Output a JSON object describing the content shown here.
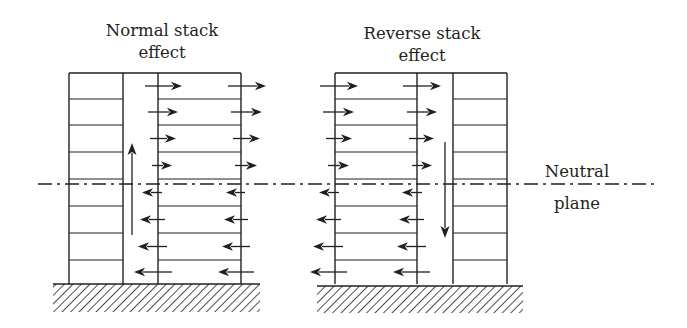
{
  "diagram": {
    "colors": {
      "ink": "#231f20",
      "background": "#ffffff"
    },
    "labels": {
      "normal_line1": "Normal stack",
      "normal_line2": "effect",
      "reverse_line1": "Reverse stack",
      "reverse_line2": "effect",
      "neutral_line1": "Neutral",
      "neutral_line2": "plane"
    },
    "neutral_plane": {
      "y": 184,
      "x_start": 38,
      "x_end": 655
    },
    "floors_y": [
      73,
      99,
      125,
      152,
      179,
      206,
      233,
      260,
      284
    ],
    "buildings": [
      {
        "name": "normal-stack-building",
        "outer_left": 69,
        "shaft_left": 123,
        "shaft_right": 158,
        "outer_right": 241,
        "ground": {
          "x1": 53,
          "x2": 260,
          "y1": 284,
          "y2": 312
        },
        "shaft_flow": {
          "direction": "up",
          "x": 132,
          "y_from": 235,
          "y_to": 143
        },
        "row_arrows": [
          {
            "dir": "right",
            "a": [
              145,
              182
            ],
            "b": [
              228,
              266
            ]
          },
          {
            "dir": "right",
            "a": [
              148,
              178
            ],
            "b": [
              231,
              262
            ]
          },
          {
            "dir": "right",
            "a": [
              150,
              176
            ],
            "b": [
              233,
              260
            ]
          },
          {
            "dir": "right",
            "a": [
              152,
              172
            ],
            "b": [
              235,
              257
            ]
          },
          {
            "dir": "left",
            "a": [
              162,
              142
            ],
            "b": [
              245,
              226
            ]
          },
          {
            "dir": "left",
            "a": [
              165,
              140
            ],
            "b": [
              248,
              224
            ]
          },
          {
            "dir": "left",
            "a": [
              167,
              138
            ],
            "b": [
              250,
              222
            ]
          },
          {
            "dir": "left",
            "a": [
              172,
              134
            ],
            "b": [
              254,
              218
            ]
          }
        ]
      },
      {
        "name": "reverse-stack-building",
        "outer_left": 335,
        "shaft_left": 417,
        "shaft_right": 453,
        "outer_right": 507,
        "ground": {
          "x1": 317,
          "x2": 523,
          "y1": 286,
          "y2": 313
        },
        "shaft_flow": {
          "direction": "down",
          "x": 445,
          "y_from": 142,
          "y_to": 238
        },
        "row_arrows": [
          {
            "dir": "right",
            "a": [
              320,
              358
            ],
            "b": [
              403,
              441
            ]
          },
          {
            "dir": "right",
            "a": [
              323,
              354
            ],
            "b": [
              407,
              437
            ]
          },
          {
            "dir": "right",
            "a": [
              326,
              352
            ],
            "b": [
              409,
              434
            ]
          },
          {
            "dir": "right",
            "a": [
              328,
              349
            ],
            "b": [
              412,
              432
            ]
          },
          {
            "dir": "left",
            "a": [
              339,
              319
            ],
            "b": [
              422,
              402
            ]
          },
          {
            "dir": "left",
            "a": [
              341,
              316
            ],
            "b": [
              424,
              399
            ]
          },
          {
            "dir": "left",
            "a": [
              343,
              313
            ],
            "b": [
              426,
              397
            ]
          },
          {
            "dir": "left",
            "a": [
              347,
              310
            ],
            "b": [
              430,
              393
            ]
          }
        ]
      }
    ],
    "label_positions": {
      "normal": {
        "x": 162,
        "y1": 36,
        "y2": 58
      },
      "reverse": {
        "x": 422,
        "y1": 39,
        "y2": 61
      },
      "neutral": {
        "x1": 577,
        "y1": 177,
        "x2": 577,
        "y2": 209
      }
    }
  }
}
